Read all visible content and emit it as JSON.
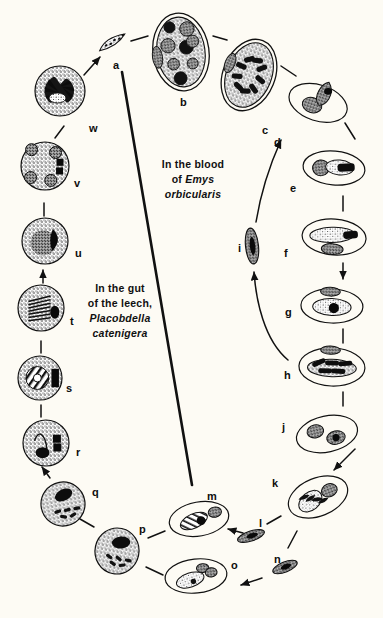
{
  "figure": {
    "type": "life-cycle-diagram",
    "background_color": "#fdfbf4",
    "ink_color": "#111111",
    "width": 383,
    "height": 618,
    "cycle_direction": "clockwise-from-a"
  },
  "captions": {
    "blood": {
      "line1": "In the blood",
      "line2_prefix": "of ",
      "line2_species": "Emys",
      "line3_species": "orbicularis"
    },
    "gut": {
      "line1": "In the gut",
      "line2": "of the leech,",
      "line3_species": "Placobdella",
      "line4_species": "catenigera"
    }
  },
  "stages": [
    {
      "id": "a",
      "label": "a",
      "label_x": 113,
      "label_y": 60,
      "cx": 112,
      "cy": 42,
      "kind": "sporozoite",
      "host_cell": false,
      "rot": -28,
      "w": 30,
      "h": 11
    },
    {
      "id": "b",
      "label": "b",
      "label_x": 180,
      "label_y": 97,
      "cx": 181,
      "cy": 52,
      "kind": "multinucleate-schizont",
      "host_cell": true,
      "rot": -8,
      "w": 56,
      "h": 78
    },
    {
      "id": "c",
      "label": "c",
      "label_x": 262,
      "label_y": 125,
      "cx": 249,
      "cy": 75,
      "kind": "merozoite-cluster",
      "host_cell": true,
      "rot": 22,
      "w": 52,
      "h": 74
    },
    {
      "id": "d",
      "label": "d",
      "label_x": 274,
      "label_y": 137,
      "cx": 319,
      "cy": 100,
      "kind": "invading-merozoite",
      "host_cell": true,
      "rot": 18,
      "w": 60,
      "h": 36
    },
    {
      "id": "e",
      "label": "e",
      "label_x": 290,
      "label_y": 183,
      "cx": 334,
      "cy": 168,
      "kind": "paired-gamonts",
      "host_cell": true,
      "rot": 5,
      "w": 62,
      "h": 34
    },
    {
      "id": "f",
      "label": "f",
      "label_x": 284,
      "label_y": 248,
      "cx": 334,
      "cy": 238,
      "kind": "gamont-pair-fused",
      "host_cell": true,
      "rot": 4,
      "w": 64,
      "h": 36
    },
    {
      "id": "g",
      "label": "g",
      "label_x": 285,
      "label_y": 307,
      "cx": 332,
      "cy": 304,
      "kind": "zygote-forming",
      "host_cell": true,
      "rot": 2,
      "w": 62,
      "h": 34
    },
    {
      "id": "h",
      "label": "h",
      "label_x": 284,
      "label_y": 370,
      "cx": 332,
      "cy": 365,
      "kind": "oocyst-sporoblasts",
      "host_cell": true,
      "rot": 2,
      "w": 66,
      "h": 38
    },
    {
      "id": "i",
      "label": "i",
      "label_x": 238,
      "label_y": 243,
      "cx": 252,
      "cy": 246,
      "kind": "sporozoite-dark",
      "host_cell": false,
      "rot": -6,
      "w": 13,
      "h": 36
    },
    {
      "id": "j",
      "label": "j",
      "label_x": 282,
      "label_y": 422,
      "cx": 327,
      "cy": 434,
      "kind": "binucleate",
      "host_cell": true,
      "rot": -12,
      "w": 62,
      "h": 36
    },
    {
      "id": "k",
      "label": "k",
      "label_x": 272,
      "label_y": 478,
      "cx": 318,
      "cy": 497,
      "kind": "sporocyst-pair",
      "host_cell": true,
      "rot": -22,
      "w": 62,
      "h": 38
    },
    {
      "id": "l",
      "label": "l",
      "label_x": 259,
      "label_y": 518,
      "cx": 251,
      "cy": 536,
      "kind": "sporozoite-dark",
      "host_cell": false,
      "rot": -18,
      "w": 28,
      "h": 10
    },
    {
      "id": "m",
      "label": "m",
      "label_x": 207,
      "label_y": 491,
      "cx": 199,
      "cy": 519,
      "kind": "striated-pair",
      "host_cell": true,
      "rot": -10,
      "w": 60,
      "h": 34
    },
    {
      "id": "n",
      "label": "n",
      "label_x": 274,
      "label_y": 554,
      "cx": 285,
      "cy": 567,
      "kind": "sporozoite-dark",
      "host_cell": false,
      "rot": -22,
      "w": 26,
      "h": 10
    },
    {
      "id": "o",
      "label": "o",
      "label_x": 231,
      "label_y": 560,
      "cx": 196,
      "cy": 576,
      "kind": "double-gamont",
      "host_cell": true,
      "rot": -6,
      "w": 62,
      "h": 34
    },
    {
      "id": "p",
      "label": "p",
      "label_x": 139,
      "label_y": 524,
      "cx": 117,
      "cy": 551,
      "kind": "round-gamont",
      "host_cell": false,
      "rot": 12,
      "w": 44,
      "h": 46
    },
    {
      "id": "q",
      "label": "q",
      "label_x": 92,
      "label_y": 487,
      "cx": 63,
      "cy": 504,
      "kind": "round-gamont",
      "host_cell": false,
      "rot": -10,
      "w": 44,
      "h": 44
    },
    {
      "id": "r",
      "label": "r",
      "label_x": 76,
      "label_y": 447,
      "cx": 46,
      "cy": 443,
      "kind": "round-schizont",
      "host_cell": false,
      "rot": 0,
      "w": 46,
      "h": 46
    },
    {
      "id": "s",
      "label": "s",
      "label_x": 66,
      "label_y": 383,
      "cx": 40,
      "cy": 378,
      "kind": "round-rosette",
      "host_cell": false,
      "rot": 0,
      "w": 44,
      "h": 44
    },
    {
      "id": "t",
      "label": "t",
      "label_x": 70,
      "label_y": 316,
      "cx": 41,
      "cy": 308,
      "kind": "round-spindle",
      "host_cell": false,
      "rot": 0,
      "w": 46,
      "h": 46
    },
    {
      "id": "u",
      "label": "u",
      "label_x": 75,
      "label_y": 248,
      "cx": 45,
      "cy": 241,
      "kind": "round-granular",
      "host_cell": false,
      "rot": 0,
      "w": 46,
      "h": 46
    },
    {
      "id": "v",
      "label": "v",
      "label_x": 74,
      "label_y": 178,
      "cx": 45,
      "cy": 166,
      "kind": "round-multinucleate",
      "host_cell": false,
      "rot": 0,
      "w": 48,
      "h": 48
    },
    {
      "id": "w",
      "label": "w",
      "label_x": 89,
      "label_y": 123,
      "cx": 60,
      "cy": 91,
      "kind": "round-fan",
      "host_cell": false,
      "rot": 0,
      "w": 50,
      "h": 50
    }
  ],
  "divider": {
    "name": "host-boundary-line",
    "x1": 122,
    "y1": 72,
    "x2": 192,
    "y2": 485,
    "stroke_width": 2.6
  },
  "connectors": [
    {
      "from": "w",
      "to": "a",
      "type": "arrow",
      "x1": 84,
      "y1": 75,
      "x2": 100,
      "y2": 57
    },
    {
      "from": "a",
      "to": "b",
      "type": "dash",
      "x1": 131,
      "y1": 41,
      "x2": 148,
      "y2": 36
    },
    {
      "from": "b",
      "to": "c",
      "type": "dash",
      "x1": 213,
      "y1": 36,
      "x2": 227,
      "y2": 40
    },
    {
      "from": "c",
      "to": "d",
      "type": "dash",
      "x1": 281,
      "y1": 66,
      "x2": 296,
      "y2": 76
    },
    {
      "from": "d",
      "to": "e",
      "type": "dash",
      "x1": 345,
      "y1": 123,
      "x2": 355,
      "y2": 139
    },
    {
      "from": "e",
      "to": "f",
      "type": "dash",
      "x1": 343,
      "y1": 196,
      "x2": 343,
      "y2": 211
    },
    {
      "from": "f",
      "to": "g",
      "type": "arrow",
      "x1": 343,
      "y1": 263,
      "x2": 343,
      "y2": 279
    },
    {
      "from": "g",
      "to": "h",
      "type": "dash",
      "x1": 343,
      "y1": 329,
      "x2": 343,
      "y2": 343
    },
    {
      "from": "h",
      "to": "j",
      "type": "dash",
      "x1": 343,
      "y1": 392,
      "x2": 343,
      "y2": 406
    },
    {
      "from": "j",
      "to": "k",
      "type": "arrow",
      "x1": 355,
      "y1": 449,
      "x2": 334,
      "y2": 470
    },
    {
      "from": "k",
      "to": "l",
      "type": "dash",
      "x1": 281,
      "y1": 516,
      "x2": 267,
      "y2": 524
    },
    {
      "from": "l",
      "to": "m",
      "type": "arrow",
      "x1": 243,
      "y1": 533,
      "x2": 228,
      "y2": 529
    },
    {
      "from": "k",
      "to": "n",
      "type": "dash",
      "x1": 297,
      "y1": 531,
      "x2": 288,
      "y2": 548
    },
    {
      "from": "n",
      "to": "o",
      "type": "arrow",
      "x1": 262,
      "y1": 578,
      "x2": 241,
      "y2": 585
    },
    {
      "from": "m",
      "to": "p",
      "type": "dash",
      "x1": 165,
      "y1": 531,
      "x2": 148,
      "y2": 538
    },
    {
      "from": "o",
      "to": "p",
      "type": "dash",
      "x1": 163,
      "y1": 575,
      "x2": 146,
      "y2": 567
    },
    {
      "from": "p",
      "to": "q",
      "type": "dash",
      "x1": 94,
      "y1": 527,
      "x2": 80,
      "y2": 519
    },
    {
      "from": "q",
      "to": "r",
      "type": "arrow",
      "x1": 50,
      "y1": 478,
      "x2": 42,
      "y2": 467
    },
    {
      "from": "r",
      "to": "s",
      "type": "dash",
      "x1": 41,
      "y1": 417,
      "x2": 41,
      "y2": 405
    },
    {
      "from": "s",
      "to": "t",
      "type": "dash",
      "x1": 41,
      "y1": 353,
      "x2": 41,
      "y2": 341
    },
    {
      "from": "t",
      "to": "u",
      "type": "arrow",
      "x1": 43,
      "y1": 283,
      "x2": 43,
      "y2": 270
    },
    {
      "from": "u",
      "to": "v",
      "type": "dash",
      "x1": 44,
      "y1": 216,
      "x2": 44,
      "y2": 203
    },
    {
      "from": "v",
      "to": "w",
      "type": "dash",
      "x1": 55,
      "y1": 138,
      "x2": 64,
      "y2": 126
    },
    {
      "from": "h",
      "to": "i",
      "type": "arrow-curve",
      "path": "M 288 360 C 264 340 256 300 254 272"
    },
    {
      "from": "i",
      "to": "d",
      "type": "arrow-curve",
      "path": "M 256 222 C 262 185 272 160 281 140"
    }
  ]
}
